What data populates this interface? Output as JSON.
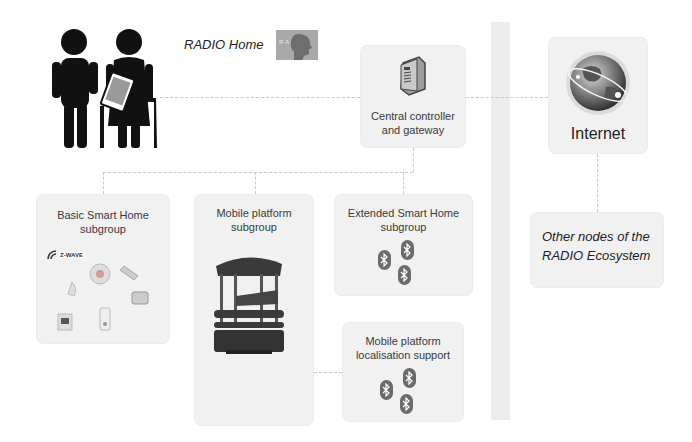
{
  "header": {
    "title": "RADIO Home",
    "logo_text": "RADIO"
  },
  "nodes": {
    "controller": {
      "label_line1": "Central controller",
      "label_line2": "and gateway",
      "icon": "server-icon"
    },
    "internet": {
      "label": "Internet",
      "icon": "globe-icon"
    },
    "other_nodes": {
      "label_line1": "Other nodes of the",
      "label_line2": "RADIO Ecosystem"
    },
    "basic_smart_home": {
      "label_line1": "Basic Smart Home",
      "label_line2": "subgroup",
      "brand": "Z-WAVE",
      "icon": "smart-home-devices-icon"
    },
    "mobile_platform": {
      "label_line1": "Mobile platform",
      "label_line2": "subgroup",
      "icon": "robot-icon"
    },
    "extended_smart_home": {
      "label_line1": "Extended Smart Home",
      "label_line2": "subgroup",
      "icon": "bluetooth-icon"
    },
    "localisation_support": {
      "label_line1": "Mobile platform",
      "label_line2": "localisation support",
      "icon": "bluetooth-icon"
    }
  },
  "users": {
    "icon": "elderly-couple-icon"
  },
  "colors": {
    "box_bg": "#f1f1f1",
    "line": "#c9c9c9",
    "wall": "#ececec",
    "icon_dark": "#111111",
    "bluetooth": "#6b6b6b"
  }
}
